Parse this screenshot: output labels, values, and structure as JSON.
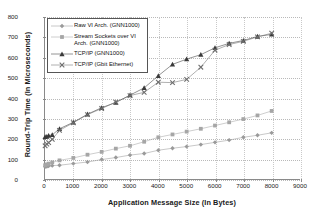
{
  "chart_data": {
    "type": "line",
    "title": "",
    "xlabel": "Application Message Size (In Bytes)",
    "ylabel": "Round-Trip Time (In Microseconds)",
    "xlim": [
      0,
      9000
    ],
    "ylim": [
      0,
      800
    ],
    "xticks": [
      0,
      1000,
      2000,
      3000,
      4000,
      5000,
      6000,
      7000,
      8000,
      9000
    ],
    "yticks": [
      0,
      100,
      200,
      300,
      400,
      500,
      600,
      700,
      800
    ],
    "grid": "dotted-both",
    "legend_position": "upper-left-inside",
    "series": [
      {
        "name": "Raw VI Arch. (GNN1000)",
        "marker": "diamond",
        "color": "#9a9a9a",
        "x": [
          4,
          64,
          128,
          256,
          512,
          1000,
          1500,
          2000,
          2500,
          3000,
          3500,
          4000,
          4500,
          5000,
          5500,
          6000,
          6500,
          7000,
          7500,
          8000
        ],
        "values": [
          60,
          62,
          64,
          66,
          68,
          76,
          84,
          96,
          106,
          118,
          126,
          142,
          152,
          160,
          170,
          181,
          192,
          206,
          216,
          228
        ]
      },
      {
        "name": "Stream Sockets over VI Arch. (GNN1000)",
        "marker": "square",
        "color": "#a6a6a6",
        "x": [
          4,
          64,
          128,
          256,
          512,
          1000,
          1500,
          2000,
          2500,
          3000,
          3500,
          4000,
          4500,
          5000,
          5500,
          6000,
          6500,
          7000,
          7500,
          8000
        ],
        "values": [
          68,
          72,
          76,
          82,
          92,
          104,
          120,
          134,
          150,
          164,
          184,
          206,
          220,
          234,
          248,
          264,
          280,
          296,
          314,
          336
        ]
      },
      {
        "name": "TCP/IP (GNN1000)",
        "marker": "triangle",
        "color": "#3a3a3a",
        "x": [
          4,
          64,
          128,
          256,
          512,
          1000,
          1500,
          2000,
          2500,
          3000,
          3500,
          4000,
          4500,
          5000,
          5500,
          6000,
          6500,
          7000,
          7500,
          8000
        ],
        "values": [
          208,
          210,
          214,
          218,
          248,
          280,
          320,
          352,
          378,
          414,
          450,
          510,
          566,
          592,
          614,
          648,
          670,
          684,
          704,
          714
        ]
      },
      {
        "name": "TCP/IP (Gbit Ethernet)",
        "marker": "x",
        "color": "#6e6e6e",
        "x": [
          4,
          64,
          128,
          256,
          512,
          1000,
          1500,
          2000,
          2500,
          3000,
          3500,
          4000,
          4500,
          5000,
          5500,
          6000,
          6500,
          7000,
          7500,
          8000
        ],
        "values": [
          164,
          172,
          180,
          196,
          240,
          278,
          318,
          348,
          380,
          412,
          428,
          478,
          476,
          492,
          552,
          636,
          664,
          680,
          702,
          720
        ]
      }
    ]
  },
  "legend": {
    "entries": [
      {
        "label": "Raw VI Arch. (GNN1000)"
      },
      {
        "label": "Stream Sockets over VI Arch. (GNN1000)"
      },
      {
        "label": "TCP/IP (GNN1000)"
      },
      {
        "label": "TCP/IP (Gbit Ethernet)"
      }
    ]
  }
}
